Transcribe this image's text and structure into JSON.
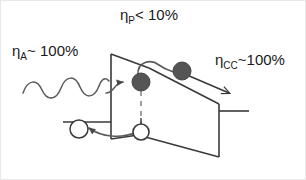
{
  "figure": {
    "type": "band-diagram",
    "background_color": "#ffffff",
    "line_color": "#3a3a3a",
    "electron_fill_color": "#555555",
    "hole_fill_color": "#ffffff",
    "text_color": "#1a1a1a"
  },
  "labels": {
    "absorption": {
      "symbol": "η",
      "subscript": "A",
      "relation": "~ 100%",
      "full": "ηA~ 100%"
    },
    "separation": {
      "symbol": "η",
      "subscript": "P",
      "relation": "< 10%",
      "full": "ηP< 10%"
    },
    "charge_collection": {
      "symbol": "η",
      "subscript": "CC",
      "relation": "~100%",
      "full": "ηCC~100%"
    }
  },
  "elements": {
    "photon_wave": "incident-photon-sine-wave",
    "absorption_arrow": "curved-arrow-into-band",
    "electron_generated": "filled-circle-electron-at-generation-site",
    "electron_transported": "filled-circle-electron-in-conduction-band",
    "hole": "open-circle-hole-in-valence-band",
    "exciton_dashed_line": "vertical-dashed-line-electron-hole-pair",
    "hop_arrow": "small-curved-arrow-electron-hop",
    "collection_arrow": "long-arrow-to-right-contact",
    "hole_arrow": "curved-arrow-to-left-contact",
    "conduction_band": "sloping-conduction-band-edge",
    "valence_band": "sloping-valence-band-edge",
    "left_contact": "left-electrode-stub",
    "right_contact": "right-electrode-stub"
  }
}
